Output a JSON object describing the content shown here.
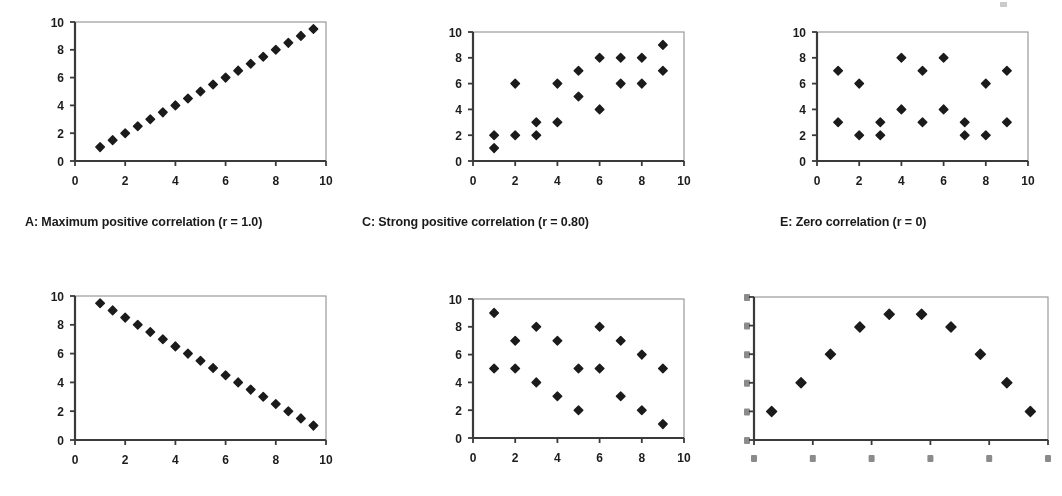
{
  "figure": {
    "marker_color": "#1b1b1b",
    "axis_color": "#3a3a3a",
    "frame_color": "#9a9a9a",
    "background": "#ffffff"
  },
  "panels": [
    {
      "id": "A",
      "caption": "A: Maximum positive correlation (r = 1.0)",
      "chart_data": {
        "type": "scatter",
        "title": "A: Maximum positive correlation (r = 1.0)",
        "xlabel": "",
        "ylabel": "",
        "xlim": [
          0,
          10
        ],
        "ylim": [
          0,
          10
        ],
        "xticks": [
          0,
          2,
          4,
          6,
          8,
          10
        ],
        "yticks": [
          0,
          2,
          4,
          6,
          8,
          10
        ],
        "grid": false,
        "legend": "none",
        "r": 1.0,
        "points": [
          [
            1,
            1
          ],
          [
            1.5,
            1.5
          ],
          [
            2,
            2
          ],
          [
            2.5,
            2.5
          ],
          [
            3,
            3
          ],
          [
            3.5,
            3.5
          ],
          [
            4,
            4
          ],
          [
            4.5,
            4.5
          ],
          [
            5,
            5
          ],
          [
            5.5,
            5.5
          ],
          [
            6,
            6
          ],
          [
            6.5,
            6.5
          ],
          [
            7,
            7
          ],
          [
            7.5,
            7.5
          ],
          [
            8,
            8
          ],
          [
            8.5,
            8.5
          ],
          [
            9,
            9
          ],
          [
            9.5,
            9.5
          ]
        ]
      }
    },
    {
      "id": "C",
      "caption": "C: Strong positive correlation (r = 0.80)",
      "chart_data": {
        "type": "scatter",
        "title": "C: Strong positive correlation (r = 0.80)",
        "xlabel": "",
        "ylabel": "",
        "xlim": [
          0,
          10
        ],
        "ylim": [
          0,
          10
        ],
        "xticks": [
          0,
          2,
          4,
          6,
          8,
          10
        ],
        "yticks": [
          0,
          2,
          4,
          6,
          8,
          10
        ],
        "grid": false,
        "legend": "none",
        "r": 0.8,
        "points": [
          [
            1,
            2
          ],
          [
            1,
            1
          ],
          [
            2,
            6
          ],
          [
            2,
            2
          ],
          [
            3,
            3
          ],
          [
            3,
            2
          ],
          [
            4,
            6
          ],
          [
            4,
            3
          ],
          [
            5,
            7
          ],
          [
            5,
            5
          ],
          [
            6,
            8
          ],
          [
            6,
            4
          ],
          [
            7,
            8
          ],
          [
            7,
            6
          ],
          [
            8,
            8
          ],
          [
            8,
            6
          ],
          [
            9,
            9
          ],
          [
            9,
            7
          ]
        ]
      }
    },
    {
      "id": "E",
      "caption": "E: Zero correlation (r = 0)",
      "chart_data": {
        "type": "scatter",
        "title": "E: Zero correlation (r = 0)",
        "xlabel": "",
        "ylabel": "",
        "xlim": [
          0,
          10
        ],
        "ylim": [
          0,
          10
        ],
        "xticks": [
          0,
          2,
          4,
          6,
          8,
          10
        ],
        "yticks": [
          0,
          2,
          4,
          6,
          8,
          10
        ],
        "grid": false,
        "legend": "none",
        "r": 0,
        "points": [
          [
            1,
            7
          ],
          [
            1,
            3
          ],
          [
            2,
            6
          ],
          [
            2,
            2
          ],
          [
            3,
            3
          ],
          [
            3,
            2
          ],
          [
            4,
            8
          ],
          [
            4,
            4
          ],
          [
            5,
            7
          ],
          [
            5,
            3
          ],
          [
            6,
            8
          ],
          [
            6,
            4
          ],
          [
            7,
            3
          ],
          [
            7,
            2
          ],
          [
            8,
            6
          ],
          [
            8,
            2
          ],
          [
            9,
            7
          ],
          [
            9,
            3
          ]
        ]
      }
    },
    {
      "id": "B",
      "caption": "",
      "chart_data": {
        "type": "scatter",
        "title": "",
        "xlabel": "",
        "ylabel": "",
        "xlim": [
          0,
          10
        ],
        "ylim": [
          0,
          10
        ],
        "xticks": [
          0,
          2,
          4,
          6,
          8,
          10
        ],
        "yticks": [
          0,
          2,
          4,
          6,
          8,
          10
        ],
        "grid": false,
        "legend": "none",
        "r": -1.0,
        "points": [
          [
            1,
            9.5
          ],
          [
            1.5,
            9
          ],
          [
            2,
            8.5
          ],
          [
            2.5,
            8
          ],
          [
            3,
            7.5
          ],
          [
            3.5,
            7
          ],
          [
            4,
            6.5
          ],
          [
            4.5,
            6
          ],
          [
            5,
            5.5
          ],
          [
            5.5,
            5
          ],
          [
            6,
            4.5
          ],
          [
            6.5,
            4
          ],
          [
            7,
            3.5
          ],
          [
            7.5,
            3
          ],
          [
            8,
            2.5
          ],
          [
            8.5,
            2
          ],
          [
            9,
            1.5
          ],
          [
            9.5,
            1
          ]
        ]
      }
    },
    {
      "id": "D",
      "caption": "",
      "chart_data": {
        "type": "scatter",
        "title": "",
        "xlabel": "",
        "ylabel": "",
        "xlim": [
          0,
          10
        ],
        "ylim": [
          0,
          10
        ],
        "xticks": [
          0,
          2,
          4,
          6,
          8,
          10
        ],
        "yticks": [
          0,
          2,
          4,
          6,
          8,
          10
        ],
        "grid": false,
        "legend": "none",
        "r": -0.8,
        "points": [
          [
            1,
            9
          ],
          [
            1,
            5
          ],
          [
            2,
            7
          ],
          [
            2,
            5
          ],
          [
            3,
            8
          ],
          [
            3,
            4
          ],
          [
            4,
            7
          ],
          [
            4,
            3
          ],
          [
            5,
            5
          ],
          [
            5,
            2
          ],
          [
            6,
            8
          ],
          [
            6,
            5
          ],
          [
            7,
            7
          ],
          [
            7,
            3
          ],
          [
            8,
            6
          ],
          [
            8,
            2
          ],
          [
            9,
            5
          ],
          [
            9,
            1
          ]
        ]
      }
    },
    {
      "id": "F",
      "caption": "",
      "chart_data": {
        "type": "scatter",
        "title": "",
        "xlabel": "",
        "ylabel": "",
        "xlim": [
          0,
          10
        ],
        "ylim": [
          0,
          10
        ],
        "xticks": [
          0,
          2,
          4,
          6,
          8,
          10
        ],
        "yticks": [
          0,
          2,
          4,
          6,
          8,
          10
        ],
        "grid": false,
        "legend": "none",
        "r": 0,
        "note": "curvilinear inverted-U relationship; axis tick labels degraded/illegible in scan",
        "points": [
          [
            0.6,
            2
          ],
          [
            1.6,
            4
          ],
          [
            2.6,
            6
          ],
          [
            3.6,
            7.9
          ],
          [
            4.6,
            8.8
          ],
          [
            5.7,
            8.8
          ],
          [
            6.7,
            7.9
          ],
          [
            7.7,
            6
          ],
          [
            8.6,
            4
          ],
          [
            9.4,
            2
          ]
        ]
      }
    }
  ],
  "axis_labels": {
    "x": [
      "0",
      "2",
      "4",
      "6",
      "8",
      "10"
    ],
    "y": [
      "0",
      "2",
      "4",
      "6",
      "8",
      "10"
    ]
  }
}
